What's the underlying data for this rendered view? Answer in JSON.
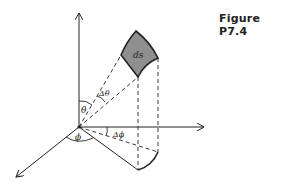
{
  "figure": {
    "caption": "Figure P7.4",
    "labels": {
      "ds": "ds",
      "theta": "θ",
      "delta_theta": "Δθ",
      "phi": "ϕ",
      "delta_phi": "Δϕ"
    },
    "colors": {
      "line": "#222222",
      "patch_fill": "#8f8f8f",
      "background": "#ffffff"
    }
  }
}
